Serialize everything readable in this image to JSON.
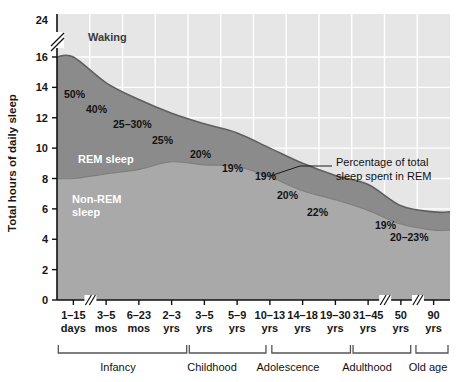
{
  "chart_data": {
    "type": "area",
    "title": "",
    "xlabel": "",
    "ylabel": "Total hours of daily sleep",
    "ylim": [
      0,
      24
    ],
    "y_ticks": [
      0,
      2,
      4,
      6,
      8,
      10,
      12,
      14,
      16,
      24
    ],
    "y_axis_break": "between 16 and 24",
    "grid": true,
    "legend_position": "inline-labels",
    "categories": [
      "1–15 days",
      "3–5 mos",
      "6–23 mos",
      "2–3 yrs",
      "3–5 yrs",
      "5–9 yrs",
      "10–13 yrs",
      "14–18 yrs",
      "19–30 yrs",
      "31–45 yrs",
      "50 yrs",
      "90 yrs"
    ],
    "category_lines": [
      [
        "1–15",
        "days"
      ],
      [
        "3–5",
        "mos"
      ],
      [
        "6–23",
        "mos"
      ],
      [
        "2–3",
        "yrs"
      ],
      [
        "3–5",
        "yrs"
      ],
      [
        "5–9",
        "yrs"
      ],
      [
        "10–13",
        "yrs"
      ],
      [
        "14–18",
        "yrs"
      ],
      [
        "19–30",
        "yrs"
      ],
      [
        "31–45",
        "yrs"
      ],
      [
        "50",
        "yrs"
      ],
      [
        "90",
        "yrs"
      ]
    ],
    "x_axis_breaks": [
      "after 1–15 days",
      "after 31–45 yrs",
      "after 50 yrs"
    ],
    "series": [
      {
        "name": "Total sleep (REM + Non-REM)",
        "values": [
          16.0,
          14.3,
          13.2,
          12.3,
          11.6,
          11.0,
          10.0,
          9.0,
          8.2,
          7.6,
          6.2,
          5.8
        ]
      },
      {
        "name": "Non-REM sleep",
        "values": [
          8.0,
          8.3,
          8.6,
          9.1,
          8.9,
          8.8,
          8.1,
          7.2,
          6.6,
          5.9,
          5.0,
          4.6
        ]
      }
    ],
    "bands": [
      {
        "name": "Waking",
        "color": "#e6e6e6",
        "label": "Waking"
      },
      {
        "name": "REM sleep",
        "color": "#8b8b8b",
        "label": "REM sleep"
      },
      {
        "name": "Non-REM sleep",
        "color": "#a9a9a9",
        "label": "Non-REM\nsleep"
      }
    ],
    "rem_percent_labels": [
      {
        "text": "50%",
        "category": "1–15 days"
      },
      {
        "text": "40%",
        "category": "3–5 mos"
      },
      {
        "text": "25–30%",
        "category": "6–23 mos"
      },
      {
        "text": "25%",
        "category": "2–3 yrs"
      },
      {
        "text": "20%",
        "category": "3–5 yrs"
      },
      {
        "text": "19%",
        "category": "5–9 yrs"
      },
      {
        "text": "19%",
        "category": "10–13 yrs"
      },
      {
        "text": "20%",
        "category": "14–18 yrs"
      },
      {
        "text": "22%",
        "category": "19–30 yrs"
      },
      {
        "text": "19%",
        "category": "31–45 yrs"
      },
      {
        "text": "20–23%",
        "category": "50–90 yrs"
      }
    ],
    "annotation": {
      "line1": "Percentage of total",
      "line2": "sleep spent in REM"
    },
    "life_stages": [
      {
        "label": "Infancy",
        "from": "1–15 days",
        "to": "2–3 yrs"
      },
      {
        "label": "Childhood",
        "from": "3–5 yrs",
        "to": "10–13 yrs"
      },
      {
        "label": "Adolescence",
        "from": "10–13 yrs",
        "to": "19–30 yrs"
      },
      {
        "label": "Adulthood",
        "from": "31–45 yrs",
        "to": "50 yrs"
      },
      {
        "label": "Old age",
        "from": "50 yrs",
        "to": "90 yrs"
      }
    ],
    "colors": {
      "waking": "#e6e6e6",
      "rem": "#8b8b8b",
      "nonrem": "#a9a9a9",
      "grid": "#ffffff",
      "axis": "#111111",
      "text": "#111111",
      "band_edge": "#6e6e6e"
    }
  },
  "y_axis": {
    "title": "Total hours of daily sleep",
    "ticks": [
      "24",
      "16",
      "14",
      "12",
      "10",
      "8",
      "6",
      "4",
      "2",
      "0"
    ]
  },
  "labels": {
    "waking": "Waking",
    "rem": "REM sleep",
    "nonrem_line1": "Non-REM",
    "nonrem_line2": "sleep"
  }
}
